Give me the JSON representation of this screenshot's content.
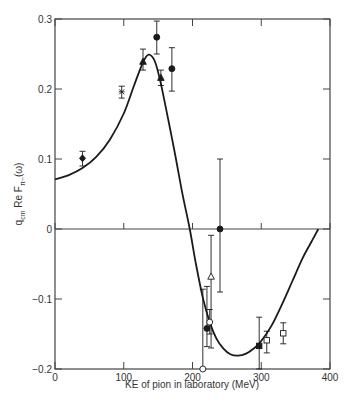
{
  "chart_data": {
    "type": "scatter",
    "title": "",
    "xlabel": "KE of pion in laboratory (MeV)",
    "ylabel_parts": {
      "main": "q",
      "sub": "cm",
      "rest": " Re F",
      "sub2": "π−",
      "tail": "(ω)"
    },
    "ylabel": "q_cm Re F_π− (ω)",
    "xlim": [
      0,
      400
    ],
    "ylim": [
      -0.2,
      0.3
    ],
    "xticks": [
      0,
      100,
      200,
      300,
      400
    ],
    "xtick_labels": [
      "0",
      "100",
      "200",
      "300",
      "400"
    ],
    "yticks": [
      0.3,
      0.2,
      0.1,
      0,
      -0.1,
      -0.2
    ],
    "ytick_labels": [
      "0.3",
      "0.2",
      "0.1",
      "0",
      "−0.1",
      "−0.2"
    ],
    "grid": false,
    "zero_line": true,
    "curve": {
      "name": "theory",
      "x": [
        0,
        20,
        40,
        60,
        80,
        100,
        115,
        128,
        136,
        145,
        153,
        165,
        175,
        185,
        196,
        205,
        215,
        225,
        235,
        245,
        255,
        266,
        278,
        290,
        300,
        315,
        330,
        345,
        360,
        372,
        383
      ],
      "y": [
        0.071,
        0.077,
        0.087,
        0.103,
        0.128,
        0.165,
        0.205,
        0.238,
        0.249,
        0.24,
        0.212,
        0.155,
        0.105,
        0.052,
        0.0,
        -0.05,
        -0.098,
        -0.133,
        -0.157,
        -0.171,
        -0.179,
        -0.181,
        -0.178,
        -0.17,
        -0.16,
        -0.138,
        -0.108,
        -0.075,
        -0.042,
        -0.02,
        0.0
      ]
    },
    "series": [
      {
        "name": "diamond-filled",
        "marker": "diamond",
        "filled": true,
        "points": [
          {
            "x": 40,
            "y": 0.101,
            "lo": 0.09,
            "hi": 0.111
          }
        ]
      },
      {
        "name": "star",
        "marker": "star",
        "filled": false,
        "points": [
          {
            "x": 97,
            "y": 0.196,
            "lo": 0.187,
            "hi": 0.204
          }
        ]
      },
      {
        "name": "triangle-filled",
        "marker": "triangle",
        "filled": true,
        "points": [
          {
            "x": 128,
            "y": 0.239,
            "lo": 0.227,
            "hi": 0.257
          },
          {
            "x": 154,
            "y": 0.216,
            "lo": 0.205,
            "hi": 0.227
          }
        ]
      },
      {
        "name": "circle-filled",
        "marker": "circle",
        "filled": true,
        "points": [
          {
            "x": 148,
            "y": 0.274,
            "lo": 0.25,
            "hi": 0.297
          },
          {
            "x": 170,
            "y": 0.229,
            "lo": 0.197,
            "hi": 0.259
          },
          {
            "x": 240,
            "y": 0.0,
            "lo": -0.09,
            "hi": 0.1
          },
          {
            "x": 221,
            "y": -0.142,
            "lo": -0.168,
            "hi": -0.082
          }
        ]
      },
      {
        "name": "triangle-open",
        "marker": "triangle",
        "filled": false,
        "points": [
          {
            "x": 227,
            "y": -0.068,
            "lo": -0.17,
            "hi": -0.009
          }
        ]
      },
      {
        "name": "circle-open",
        "marker": "circle",
        "filled": false,
        "points": [
          {
            "x": 225,
            "y": -0.133,
            "lo": -0.15,
            "hi": -0.115
          },
          {
            "x": 215,
            "y": -0.2,
            "lo": -0.2,
            "hi": -0.086
          }
        ]
      },
      {
        "name": "square-filled",
        "marker": "square",
        "filled": true,
        "points": [
          {
            "x": 297,
            "y": -0.167,
            "lo": -0.2,
            "hi": -0.126
          }
        ]
      },
      {
        "name": "square-open",
        "marker": "square",
        "filled": false,
        "points": [
          {
            "x": 308,
            "y": -0.159,
            "lo": -0.177,
            "hi": -0.146
          },
          {
            "x": 332,
            "y": -0.149,
            "lo": -0.164,
            "hi": -0.134
          }
        ]
      }
    ],
    "colors": {
      "axis": "#444444",
      "curve": "#1a1a1a",
      "marker": "#1a1a1a",
      "background": "#ffffff"
    }
  }
}
